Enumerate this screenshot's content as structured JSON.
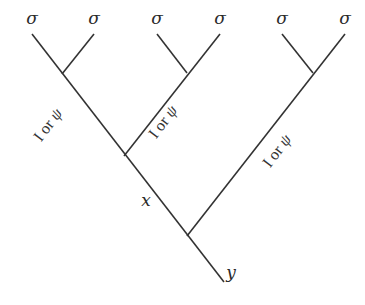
{
  "diagram": {
    "title": "",
    "leaves": [
      {
        "label": "σ",
        "x": 32,
        "y": 22
      },
      {
        "label": "σ",
        "x": 94,
        "y": 22
      },
      {
        "label": "σ",
        "x": 157,
        "y": 22
      },
      {
        "label": "σ",
        "x": 220,
        "y": 22
      },
      {
        "label": "σ",
        "x": 282,
        "y": 22
      },
      {
        "label": "σ",
        "x": 345,
        "y": 22
      }
    ],
    "internal_labels": {
      "x": "x",
      "y": "y"
    },
    "edge_labels": [
      {
        "prefix": "I or ",
        "symbol": "ψ"
      },
      {
        "prefix": "I or ",
        "symbol": "ψ"
      },
      {
        "prefix": "I or ",
        "symbol": "ψ"
      }
    ],
    "colors": {
      "line": "#333333",
      "text": "#2a2a2a",
      "background": "#ffffff"
    }
  }
}
